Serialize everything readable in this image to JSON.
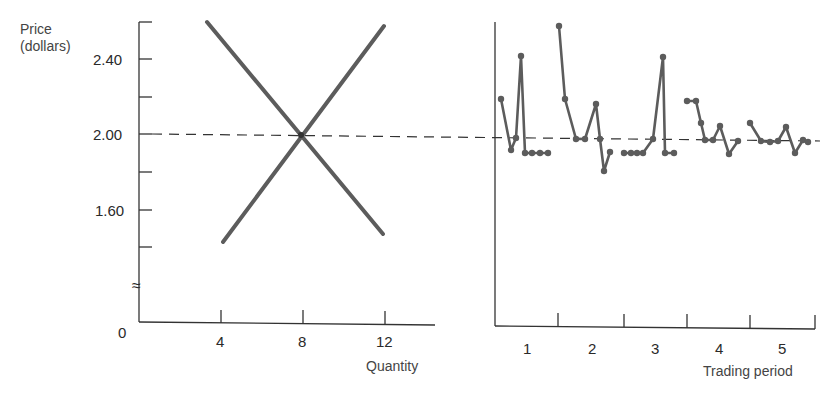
{
  "chart_data": [
    {
      "type": "line",
      "title": "",
      "xlabel": "Quantity",
      "ylabel": "Price (dollars)",
      "ylabel_lines": [
        "Price",
        "(dollars)"
      ],
      "x_ticks": [
        4,
        8,
        12
      ],
      "x_tick_labels": [
        "4",
        "8",
        "12"
      ],
      "y_ticks": [
        1.6,
        2.0,
        2.4
      ],
      "y_tick_labels": [
        "1.60",
        "2.00",
        "2.40"
      ],
      "y_origin_label": "0",
      "axis_break": "≈",
      "xlim": [
        0,
        14.5
      ],
      "ylim": [
        1.3,
        2.65
      ],
      "grid": false,
      "equilibrium": {
        "quantity": 8,
        "price": 2.0
      },
      "series": [
        {
          "name": "Demand",
          "x": [
            3.1,
            11.9
          ],
          "y": [
            2.6,
            1.44
          ],
          "color": "#5a5a5a"
        },
        {
          "name": "Supply",
          "x": [
            4.0,
            12.0
          ],
          "y": [
            1.41,
            2.57
          ],
          "color": "#5a5a5a"
        }
      ],
      "reference_line": {
        "y": 2.0,
        "style": "dashed"
      }
    },
    {
      "type": "line",
      "title": "",
      "xlabel": "Trading period",
      "ylabel": "Price (dollars)",
      "categories": [
        "1",
        "2",
        "3",
        "4",
        "5"
      ],
      "ylim": [
        1.3,
        2.65
      ],
      "grid": false,
      "reference_line": {
        "y": 2.0,
        "style": "dashed"
      },
      "series": [
        {
          "name": "Period 1",
          "values": [
            2.19,
            1.96,
            2.03,
            2.41,
            1.92,
            1.92,
            1.92,
            1.92
          ]
        },
        {
          "name": "Period 2",
          "values": [
            2.61,
            2.19,
            2.0,
            2.0,
            2.16,
            2.0,
            1.83,
            1.93
          ]
        },
        {
          "name": "Period 3",
          "values": [
            1.92,
            1.92,
            1.92,
            1.92,
            2.0,
            2.41,
            1.92,
            1.92
          ]
        },
        {
          "name": "Period 4",
          "values": [
            2.2,
            2.2,
            2.06,
            1.98,
            1.98,
            2.05,
            1.91,
            1.98
          ]
        },
        {
          "name": "Period 5",
          "values": [
            2.07,
            1.98,
            1.98,
            1.98,
            2.04,
            1.92,
            1.99,
            1.98
          ]
        }
      ]
    }
  ],
  "labels": {
    "price_line1": "Price",
    "price_line2": "(dollars)",
    "y240": "2.40",
    "y200": "2.00",
    "y160": "1.60",
    "y0": "0",
    "break": "≈",
    "x4": "4",
    "x8": "8",
    "x12": "12",
    "quantity": "Quantity",
    "p1": "1",
    "p2": "2",
    "p3": "3",
    "p4": "4",
    "p5": "5",
    "trading_period": "Trading period"
  },
  "colors": {
    "axis": "#333333",
    "curve": "#5c5c5c",
    "dashed": "#333333"
  },
  "geometry": {
    "left": {
      "axis_x": 139,
      "axis_top": 22,
      "axis_bottom": 322,
      "axis_right": 435,
      "q_px_per_unit": 20.5,
      "q_origin_px": 139,
      "p200_px": 134,
      "px_per_dollar": 376
    },
    "right": {
      "axis_x": 495,
      "axis_top": 22,
      "axis_bottom": 326,
      "axis_right": 815,
      "period_ticks_px": [
        558,
        624,
        687,
        750,
        815
      ],
      "points_px": [
        [
          [
            501,
            99
          ],
          [
            511,
            150
          ],
          [
            516,
            138
          ],
          [
            521,
            56
          ],
          [
            525,
            153
          ],
          [
            532,
            153
          ],
          [
            540,
            153
          ],
          [
            548,
            153
          ]
        ],
        [
          [
            559,
            26
          ],
          [
            565,
            99
          ],
          [
            576,
            139
          ],
          [
            585,
            139
          ],
          [
            596,
            104
          ],
          [
            600,
            139
          ],
          [
            604,
            171
          ],
          [
            610,
            152
          ]
        ],
        [
          [
            624,
            153
          ],
          [
            631,
            153
          ],
          [
            637,
            153
          ],
          [
            643,
            153
          ],
          [
            653,
            139
          ],
          [
            663,
            57
          ],
          [
            665,
            153
          ],
          [
            674,
            153
          ]
        ],
        [
          [
            687,
            101
          ],
          [
            696,
            101
          ],
          [
            701,
            123
          ],
          [
            705,
            140
          ],
          [
            713,
            140
          ],
          [
            720,
            126
          ],
          [
            729,
            154
          ],
          [
            738,
            141
          ]
        ],
        [
          [
            750,
            123
          ],
          [
            761,
            141
          ],
          [
            770,
            142
          ],
          [
            778,
            141
          ],
          [
            786,
            127
          ],
          [
            795,
            153
          ],
          [
            803,
            140
          ],
          [
            808,
            142
          ]
        ]
      ]
    }
  }
}
